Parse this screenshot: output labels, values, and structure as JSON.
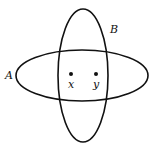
{
  "diagram": {
    "type": "venn",
    "sets": [
      {
        "id": "A",
        "label": "A",
        "cx": 82,
        "cy": 75.5,
        "rx": 66,
        "ry": 25.5
      },
      {
        "id": "B",
        "label": "B",
        "cx": 83,
        "cy": 75.5,
        "rx": 25,
        "ry": 66.5
      }
    ],
    "points": [
      {
        "id": "x",
        "label": "x",
        "cx": 71,
        "cy": 74
      },
      {
        "id": "y",
        "label": "y",
        "cx": 96,
        "cy": 74
      }
    ],
    "stroke_color": "#111111"
  }
}
